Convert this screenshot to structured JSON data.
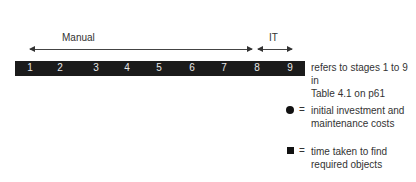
{
  "phases": [
    {
      "label": "Manual",
      "from_stage": 1,
      "to_stage": 8
    },
    {
      "label": "IT",
      "from_stage": 8,
      "to_stage": 9
    }
  ],
  "stages": [
    "1",
    "2",
    "3",
    "4",
    "5",
    "6",
    "7",
    "8",
    "9"
  ],
  "note": {
    "line1": "refers to stages 1 to 9 in",
    "line2": "Table 4.1 on p61"
  },
  "legend": [
    {
      "symbol": "circle",
      "eq": "=",
      "line1": "initial investment and",
      "line2": "maintenance costs"
    },
    {
      "symbol": "square",
      "eq": "=",
      "line1": "time taken to find",
      "line2": "required objects"
    }
  ],
  "colors": {
    "bar": "#1b1b1b",
    "stage_text": "#e8e8e8",
    "text": "#333333"
  }
}
